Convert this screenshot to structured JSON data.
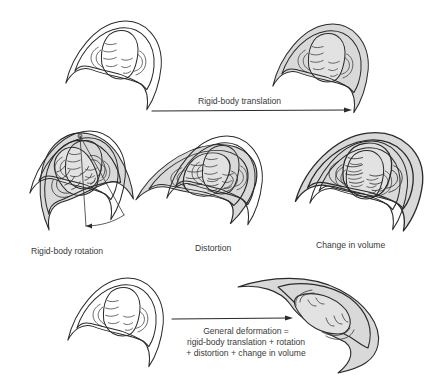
{
  "figure": {
    "panels": [
      {
        "id": "original-top",
        "description": "Undeformed trilobite cephalon (outline)"
      },
      {
        "id": "translated",
        "description": "Trilobite after rigid-body translation (shaded)"
      },
      {
        "id": "rotation",
        "description": "Trilobite after rigid-body rotation with rotation angle marker"
      },
      {
        "id": "distortion",
        "description": "Distorted trilobite overlaid on original"
      },
      {
        "id": "volume",
        "description": "Trilobite after change in volume overlaid on original"
      },
      {
        "id": "original-bottom",
        "description": "Undeformed trilobite cephalon (outline)"
      },
      {
        "id": "general",
        "description": "Trilobite after general deformation (shaded)"
      }
    ],
    "labels": {
      "translation": "Rigid-body translation",
      "rotation": "Rigid-body rotation",
      "distortion": "Distortion",
      "volume": "Change in volume",
      "general_line1": "General deformation =",
      "general_line2": "rigid-body translation + rotation",
      "general_line3": "+ distortion + change in volume"
    },
    "colors": {
      "line": "#2a2a2a",
      "shade": "#d9d9d9",
      "text": "#3a3a3a"
    }
  }
}
